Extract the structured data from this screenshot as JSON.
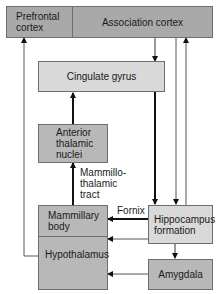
{
  "nodes": {
    "prefrontal_cortex": "Prefrontal cortex",
    "association_cortex": "Association cortex",
    "cingulate_gyrus": "Cingulate gyrus",
    "anterior_thalamic_nuclei": "Anterior thalamic nuclei",
    "mammillary_body": "Mammillary body",
    "hypothalamus": "Hypothalamus",
    "hippocampus_formation": "Hippocampus formation",
    "amygdala": "Amygdala"
  },
  "edge_labels": {
    "mammillothalamic_tract": "Mammillo-thalamic tract",
    "fornix": "Fornix"
  },
  "edges": [
    {
      "from": "association_cortex",
      "to": "cingulate_gyrus",
      "weight": "thin"
    },
    {
      "from": "cingulate_gyrus",
      "to": "hippocampus_formation",
      "weight": "thick"
    },
    {
      "from": "association_cortex",
      "to": "hippocampus_formation",
      "weight": "thin"
    },
    {
      "from": "hippocampus_formation",
      "to": "association_cortex",
      "weight": "thin"
    },
    {
      "from": "anterior_thalamic_nuclei",
      "to": "cingulate_gyrus",
      "weight": "thick"
    },
    {
      "from": "mammillary_body",
      "to": "anterior_thalamic_nuclei",
      "weight": "thick",
      "label": "Mammillo-thalamic tract"
    },
    {
      "from": "hippocampus_formation",
      "to": "mammillary_body",
      "weight": "thick",
      "label": "Fornix"
    },
    {
      "from": "hippocampus_formation",
      "to": "hypothalamus",
      "weight": "thin"
    },
    {
      "from": "hippocampus_formation",
      "to": "amygdala",
      "weight": "thin"
    },
    {
      "from": "amygdala",
      "to": "hypothalamus",
      "weight": "thin"
    },
    {
      "from": "hypothalamus",
      "to": "prefrontal_cortex",
      "weight": "thin"
    }
  ]
}
